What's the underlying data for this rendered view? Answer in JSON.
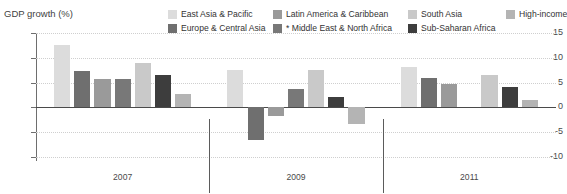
{
  "axis": {
    "y_title": "GDP growth (%)",
    "y_ticks": [
      "15",
      "10",
      "5",
      "0",
      "-5",
      "-10"
    ],
    "x_labels": [
      "2007",
      "2009",
      "2011"
    ]
  },
  "legend": {
    "row0": [
      {
        "label": "East Asia & Pacific",
        "color": "#dcdcdc"
      },
      {
        "label": "Latin America & Caribbean",
        "color": "#9a9a9a"
      },
      {
        "label": "South Asia",
        "color": "#c9c9c9"
      },
      {
        "label": "High-income",
        "color": "#b4b4b4"
      }
    ],
    "row1": [
      {
        "label": "Europe & Central Asia",
        "color": "#6f6f6f"
      },
      {
        "label": "* Middle East & North Africa",
        "color": "#787878"
      },
      {
        "label": "Sub-Saharan Africa",
        "color": "#3d3d3d"
      }
    ]
  },
  "chart_data": {
    "type": "bar",
    "title": "",
    "xlabel": "",
    "ylabel": "GDP growth (%)",
    "ylim": [
      -10,
      15
    ],
    "ytick_step": 5,
    "grid": true,
    "legend_position": "top-right",
    "categories": [
      "2007",
      "2009",
      "2011"
    ],
    "series": [
      {
        "name": "East Asia & Pacific",
        "color": "#dcdcdc",
        "values": [
          12.5,
          7.5,
          8.2
        ]
      },
      {
        "name": "Europe & Central Asia",
        "color": "#6f6f6f",
        "values": [
          7.3,
          -6.5,
          6.0
        ]
      },
      {
        "name": "Latin America & Caribbean",
        "color": "#9a9a9a",
        "values": [
          5.8,
          -1.7,
          4.8
        ]
      },
      {
        "name": "* Middle East & North Africa",
        "color": "#787878",
        "values": [
          5.8,
          3.8,
          0.0
        ]
      },
      {
        "name": "South Asia",
        "color": "#c9c9c9",
        "values": [
          8.9,
          7.5,
          6.5
        ]
      },
      {
        "name": "Sub-Saharan Africa",
        "color": "#3d3d3d",
        "values": [
          6.5,
          2.1,
          4.2
        ]
      },
      {
        "name": "High-income",
        "color": "#b4b4b4",
        "values": [
          2.8,
          -3.4,
          1.5
        ]
      }
    ]
  }
}
